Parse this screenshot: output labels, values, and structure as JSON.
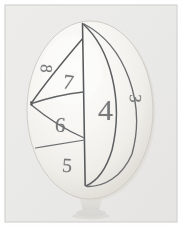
{
  "scene": {
    "title": "Hand-numbered ball on stand",
    "description": "Photograph of a pale rounded ball resting on a small stand, marked with pencil lines dividing its surface into lens and triangular regions, each hand-numbered.",
    "object_name": "numbered-ball",
    "support_name": "ball-stand"
  },
  "colors": {
    "photo_background": "#ebeae8",
    "frame_border": "#d2d2d0",
    "outer_page": "#ffffff",
    "ball_light": "#fbfbf9",
    "ball_mid": "#f2f1ee",
    "ball_shadow": "#dedbd6",
    "ball_edge": "#cfccc6",
    "pencil_line": "#5f6163",
    "pencil_line_soft": "#8a8c8d",
    "digit_color": "#6d6f70",
    "stand_color": "#e3e1dd",
    "stand_shadow": "#cfcdc9"
  },
  "ball": {
    "center_x": 90,
    "center_y": 110,
    "radius_x": 63,
    "radius_y": 89
  },
  "labels": [
    {
      "id": "digit-8",
      "text": "8",
      "x": 42,
      "y": 60,
      "size": 17,
      "rotation": 96,
      "region": "upper-left-sliver"
    },
    {
      "id": "digit-7",
      "text": "7",
      "x": 63,
      "y": 72,
      "size": 21,
      "rotation": 8,
      "region": "upper-triangle"
    },
    {
      "id": "digit-6",
      "text": "6",
      "x": 55,
      "y": 115,
      "size": 21,
      "rotation": 4,
      "region": "middle-band"
    },
    {
      "id": "digit-5",
      "text": "5",
      "x": 62,
      "y": 155,
      "size": 20,
      "rotation": 3,
      "region": "lower-band"
    },
    {
      "id": "digit-4",
      "text": "4",
      "x": 98,
      "y": 95,
      "size": 30,
      "rotation": 0,
      "region": "central-lens"
    },
    {
      "id": "digit-3",
      "text": "3",
      "x": 131,
      "y": 90,
      "size": 17,
      "rotation": 92,
      "region": "right-lens"
    }
  ],
  "pencil_marks": [
    {
      "id": "meridian-vertical",
      "kind": "line",
      "description": "Near-vertical meridian from ball top to ball bottom"
    },
    {
      "id": "meridian-left-lens",
      "kind": "curve",
      "description": "Left-bowing meridian forming the lens containing 4"
    },
    {
      "id": "meridian-right-lens",
      "kind": "curve",
      "description": "Right-bowing meridian forming the lens containing 3"
    },
    {
      "id": "chord-top-to-left",
      "kind": "line",
      "description": "Straight chord from upper meridian junction down to the left vertex"
    },
    {
      "id": "chord-mid-upper",
      "kind": "line",
      "description": "Chord from left vertex across to the vertical meridian bounding region 7 and 6"
    },
    {
      "id": "chord-mid-lower",
      "kind": "line",
      "description": "Chord separating region 6 from region 5"
    },
    {
      "id": "chord-lower",
      "kind": "line",
      "description": "Lower chord bounding region 5"
    }
  ],
  "frame": {
    "inset_left": 5,
    "inset_top": 5,
    "inset_right": 5,
    "inset_bottom": 5
  }
}
